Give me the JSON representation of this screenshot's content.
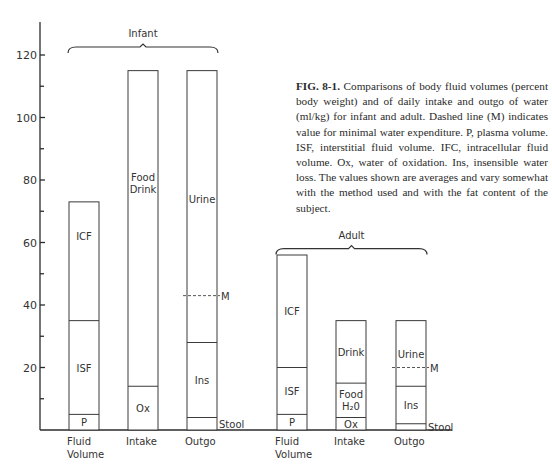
{
  "chart_data": {
    "type": "bar",
    "stacked": true,
    "ylim": [
      0,
      130
    ],
    "yticks": [
      20,
      40,
      60,
      80,
      100,
      120
    ],
    "minor_ticks": [
      10,
      30,
      50,
      70,
      90,
      110
    ],
    "xlabel": "",
    "ylabel": "",
    "groups": [
      {
        "name": "Infant",
        "bars": [
          {
            "category": "Fluid Volume",
            "label_lines": [
              "Fluid",
              "Volume"
            ],
            "segments": [
              {
                "name": "P",
                "from": 0,
                "to": 5
              },
              {
                "name": "ISF",
                "from": 5,
                "to": 35
              },
              {
                "name": "ICF",
                "from": 35,
                "to": 73
              }
            ]
          },
          {
            "category": "Intake",
            "label_lines": [
              "Intake"
            ],
            "segments": [
              {
                "name": "Ox",
                "from": 0,
                "to": 14
              },
              {
                "name": "Food Drink",
                "label_lines": [
                  "Food",
                  "Drink"
                ],
                "from": 14,
                "to": 115
              }
            ]
          },
          {
            "category": "Outgo",
            "label_lines": [
              "Outgo"
            ],
            "segments": [
              {
                "name": "Stool",
                "from": 0,
                "to": 4,
                "label_outside": true
              },
              {
                "name": "Ins",
                "from": 4,
                "to": 28
              },
              {
                "name": "Urine",
                "from": 28,
                "to": 115
              }
            ],
            "marker": {
              "name": "M",
              "value": 43
            }
          }
        ]
      },
      {
        "name": "Adult",
        "bars": [
          {
            "category": "Fluid Volume",
            "label_lines": [
              "Fluid",
              "Volume"
            ],
            "segments": [
              {
                "name": "P",
                "from": 0,
                "to": 5
              },
              {
                "name": "ISF",
                "from": 5,
                "to": 20
              },
              {
                "name": "ICF",
                "from": 20,
                "to": 56
              }
            ]
          },
          {
            "category": "Intake",
            "label_lines": [
              "Intake"
            ],
            "segments": [
              {
                "name": "Ox",
                "from": 0,
                "to": 4
              },
              {
                "name": "Food H2O",
                "label_lines": [
                  "Food",
                  "H₂0"
                ],
                "from": 4,
                "to": 15
              },
              {
                "name": "Drink",
                "from": 15,
                "to": 35
              }
            ]
          },
          {
            "category": "Outgo",
            "label_lines": [
              "Outgo"
            ],
            "segments": [
              {
                "name": "Stool",
                "from": 0,
                "to": 2,
                "label_outside": true
              },
              {
                "name": "Ins",
                "from": 2,
                "to": 14
              },
              {
                "name": "Urine",
                "from": 14,
                "to": 35
              }
            ],
            "marker": {
              "name": "M",
              "value": 20
            }
          }
        ]
      }
    ]
  },
  "caption": {
    "fig_label": "FIG. 8-1.",
    "text": " Comparisons of body fluid volumes (percent body weight) and of daily intake and outgo of water (ml/kg) for infant and adult. Dashed line (M) indicates value for minimal water expenditure. P, plasma volume. ISF, interstitial fluid volume. IFC, intracellular fluid volume. Ox, water of oxidation. Ins, insensible water loss. The values shown are averages and vary somewhat with the method used and with the fat content of the subject."
  }
}
